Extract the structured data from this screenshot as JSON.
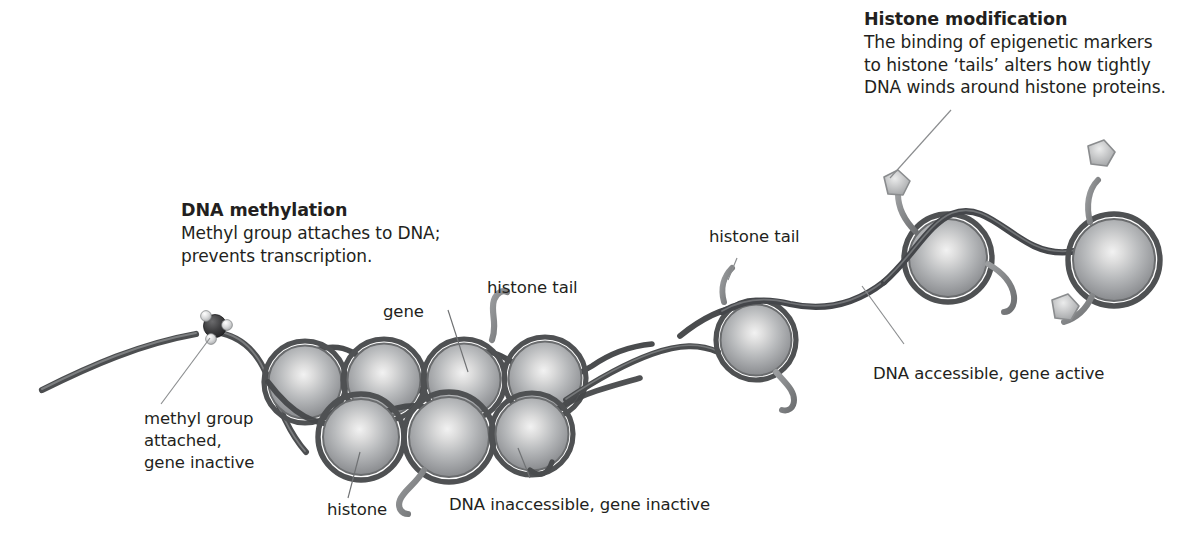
{
  "figure": {
    "type": "diagram",
    "background_color": "#ffffff",
    "text_color": "#231f20",
    "line_color": "#6e6e6e",
    "dna_color": "#58595b",
    "histone_color": "#a7a9ac",
    "marker_color": "#bcbec0",
    "methyl_color": "#3a3a3c"
  },
  "callouts": {
    "dna_methylation": {
      "heading": "DNA methylation",
      "line1": "Methyl group attaches to DNA;",
      "line2": "prevents transcription."
    },
    "histone_modification": {
      "heading": "Histone modification",
      "line1": "The binding of epigenetic markers",
      "line2": "to histone ‘tails’ alters how tightly",
      "line3": "DNA winds around histone proteins."
    }
  },
  "labels": {
    "methyl_group": {
      "line1": "methyl group",
      "line2": "attached,",
      "line3": "gene inactive"
    },
    "gene": "gene",
    "histone_tail_left": "histone tail",
    "histone_tail_right": "histone tail",
    "histone": "histone",
    "dna_inaccessible": "DNA inaccessible, gene inactive",
    "dna_accessible": "DNA accessible, gene active"
  },
  "elements": {
    "histone_count_cluster": 7,
    "histone_count_open": 3,
    "methyl_group_count": 1,
    "epigenetic_marker_count": 3
  }
}
